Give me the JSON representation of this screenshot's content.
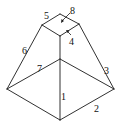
{
  "diagram": {
    "type": "truncated-pyramid-wireframe",
    "edge_labels": [
      {
        "id": "1",
        "text": "1"
      },
      {
        "id": "2",
        "text": "2"
      },
      {
        "id": "3",
        "text": "3"
      },
      {
        "id": "4",
        "text": "4"
      },
      {
        "id": "5",
        "text": "5"
      },
      {
        "id": "6",
        "text": "6"
      },
      {
        "id": "7",
        "text": "7"
      },
      {
        "id": "8",
        "text": "8"
      }
    ],
    "colors": {
      "line": "#1a1a1a",
      "background": "#ffffff"
    }
  }
}
